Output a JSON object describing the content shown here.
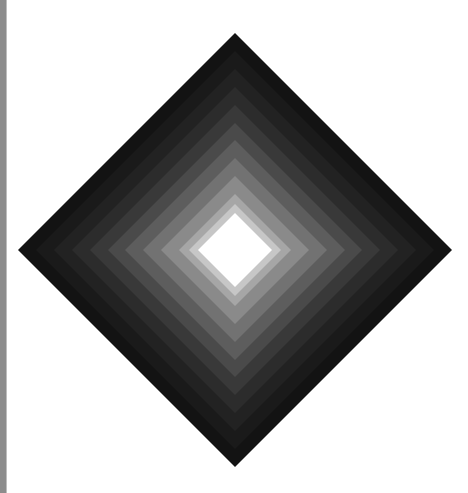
{
  "image": {
    "description": "Concentric grayscale diamond gradient",
    "width": 468,
    "height": 493,
    "background": "#ffffff",
    "edge_bar": {
      "color": "#8c8c8c",
      "width": 6
    },
    "diamond": {
      "center_x": 235,
      "center_y": 250,
      "bands": [
        {
          "half_size": 217,
          "color": "#131313"
        },
        {
          "half_size": 199,
          "color": "#1a1a1a"
        },
        {
          "half_size": 181,
          "color": "#222222"
        },
        {
          "half_size": 163,
          "color": "#2c2c2c"
        },
        {
          "half_size": 145,
          "color": "#393939"
        },
        {
          "half_size": 127,
          "color": "#4a4a4a"
        },
        {
          "half_size": 110,
          "color": "#5d5d5d"
        },
        {
          "half_size": 92,
          "color": "#727272"
        },
        {
          "half_size": 74,
          "color": "#8a8a8a"
        },
        {
          "half_size": 56,
          "color": "#a6a6a6"
        },
        {
          "half_size": 46,
          "color": "#c6c6c6"
        },
        {
          "half_size": 37,
          "color": "#ffffff"
        }
      ]
    }
  }
}
